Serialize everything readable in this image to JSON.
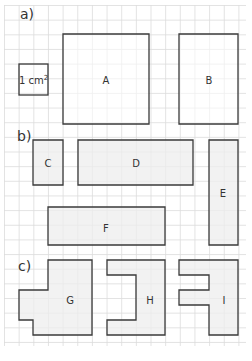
{
  "grid": {
    "origin_x": 4.5,
    "origin_y": 5.5,
    "spacing": 14.65,
    "cols": 17,
    "rows": 23,
    "line_color": "#dcdcdc",
    "extent": {
      "x1": 4,
      "y1": 5,
      "x2": 246,
      "y2": 346
    }
  },
  "colors": {
    "stroke": "#3a3a3a",
    "fill_white": "#ffffff",
    "fill_gray": "#eeeeee"
  },
  "sections": [
    {
      "id": "a",
      "label": "a)",
      "x": 20,
      "y": 6
    },
    {
      "id": "b",
      "label": "b)",
      "x": 17,
      "y": 128
    },
    {
      "id": "c",
      "label": "c)",
      "x": 18,
      "y": 258
    }
  ],
  "unit_square": {
    "text": "1 cm",
    "superscript": "2",
    "x": 19,
    "y": 64,
    "w": 29,
    "h": 31
  },
  "shapes": [
    {
      "id": "A",
      "label": "A",
      "fill": "white",
      "points": [
        [
          63,
          34
        ],
        [
          149,
          34
        ],
        [
          149,
          124
        ],
        [
          63,
          124
        ]
      ],
      "label_x": 106,
      "label_y": 80
    },
    {
      "id": "B",
      "label": "B",
      "fill": "white",
      "points": [
        [
          179,
          34
        ],
        [
          238,
          34
        ],
        [
          238,
          124
        ],
        [
          179,
          124
        ]
      ],
      "label_x": 209,
      "label_y": 80
    },
    {
      "id": "C",
      "label": "C",
      "fill": "gray",
      "points": [
        [
          33,
          140
        ],
        [
          63,
          140
        ],
        [
          63,
          185
        ],
        [
          33,
          185
        ]
      ],
      "label_x": 48,
      "label_y": 163
    },
    {
      "id": "D",
      "label": "D",
      "fill": "gray",
      "points": [
        [
          78,
          140
        ],
        [
          193,
          140
        ],
        [
          193,
          185
        ],
        [
          78,
          185
        ]
      ],
      "label_x": 136,
      "label_y": 163
    },
    {
      "id": "E",
      "label": "E",
      "fill": "gray",
      "points": [
        [
          209,
          140
        ],
        [
          238,
          140
        ],
        [
          238,
          245
        ],
        [
          209,
          245
        ]
      ],
      "label_x": 223,
      "label_y": 193
    },
    {
      "id": "F",
      "label": "F",
      "fill": "gray",
      "points": [
        [
          48,
          207
        ],
        [
          165,
          207
        ],
        [
          165,
          245
        ],
        [
          48,
          245
        ]
      ],
      "label_x": 106,
      "label_y": 228
    },
    {
      "id": "G",
      "label": "G",
      "fill": "gray",
      "points": [
        [
          48,
          260
        ],
        [
          92,
          260
        ],
        [
          92,
          335
        ],
        [
          33,
          335
        ],
        [
          33,
          320
        ],
        [
          19,
          320
        ],
        [
          19,
          290
        ],
        [
          48,
          290
        ]
      ],
      "label_x": 70,
      "label_y": 300
    },
    {
      "id": "H",
      "label": "H",
      "fill": "gray",
      "points": [
        [
          107,
          260
        ],
        [
          165,
          260
        ],
        [
          165,
          335
        ],
        [
          107,
          335
        ],
        [
          107,
          320
        ],
        [
          136,
          320
        ],
        [
          136,
          275
        ],
        [
          107,
          275
        ]
      ],
      "label_x": 150,
      "label_y": 300
    },
    {
      "id": "I",
      "label": "I",
      "fill": "gray",
      "points": [
        [
          179,
          260
        ],
        [
          238,
          260
        ],
        [
          238,
          335
        ],
        [
          209,
          335
        ],
        [
          209,
          305
        ],
        [
          179,
          305
        ],
        [
          179,
          290
        ],
        [
          209,
          290
        ],
        [
          209,
          275
        ],
        [
          179,
          275
        ]
      ],
      "label_x": 224,
      "label_y": 300
    }
  ]
}
